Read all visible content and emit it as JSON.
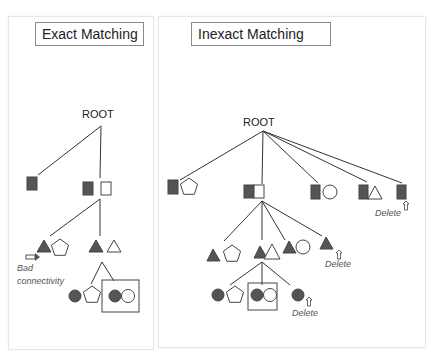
{
  "panels": {
    "exact": {
      "title": "Exact Matching",
      "root_label": "ROOT",
      "annotation": [
        "Bad",
        "connectivity"
      ]
    },
    "inexact": {
      "title": "Inexact Matching",
      "root_label": "ROOT",
      "delete_labels": [
        "Delete",
        "Delete",
        "Delete"
      ]
    }
  },
  "colors": {
    "filled": "#555555",
    "line": "#333333",
    "panel_border": "#e6e6e6",
    "title_border": "#8a8a8a"
  },
  "legend_of_shapes": {
    "node_types": [
      "filled-square",
      "hollow-square",
      "pentagon",
      "filled-triangle",
      "hollow-triangle",
      "filled-circle",
      "hollow-circle"
    ]
  }
}
